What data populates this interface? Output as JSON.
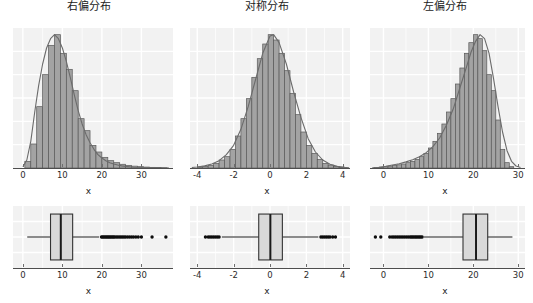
{
  "figure": {
    "width": 533,
    "height": 303,
    "background": "#ffffff",
    "panel_background": "#f2f2f2",
    "gridline_color": "#ffffff",
    "bar_fill": "#a3a3a3",
    "bar_stroke": "#595959",
    "density_stroke": "#6b6b6b",
    "box_fill": "#d9d9d9",
    "box_stroke": "#333333",
    "median_color": "#1a1a1a",
    "whisker_color": "#1a1a1a",
    "outlier_color": "#0d0d0d",
    "axis_color": "#4d4d4d"
  },
  "panels": [
    {
      "id": "right-skewed",
      "title": "右偏分布",
      "xlabel": "x",
      "xlim": [
        -2.5,
        38
      ],
      "xticks": [
        0,
        10,
        20,
        30
      ],
      "xtick_labels": [
        "0",
        "10",
        "20",
        "30"
      ]
    },
    {
      "id": "symmetric",
      "title": "对称分布",
      "xlabel": "x",
      "xlim": [
        -4.4,
        4.4
      ],
      "xticks": [
        -4,
        -2,
        0,
        2,
        4
      ],
      "xtick_labels": [
        "-4",
        "-2",
        "0",
        "2",
        "4"
      ]
    },
    {
      "id": "left-skewed",
      "title": "左偏分布",
      "xlabel": "x",
      "xlim": [
        -3.0,
        31.5
      ],
      "xticks": [
        0,
        10,
        20,
        30
      ],
      "xtick_labels": [
        "0",
        "10",
        "20",
        "30"
      ]
    }
  ],
  "chart_data": [
    {
      "type": "bar",
      "id": "hist-right-skewed",
      "title": "右偏分布",
      "xlabel": "x",
      "ylabel": "",
      "xlim": [
        -2.5,
        38
      ],
      "ylim": [
        0,
        1.05
      ],
      "xticks": [
        0,
        10,
        20,
        30
      ],
      "grid": true,
      "note": "histogram with overlaid kernel density curve; heights normalized to peak = 1.0",
      "bin_edges": [
        0.5,
        2.0,
        3.5,
        5.0,
        6.5,
        8.0,
        9.5,
        11.0,
        12.5,
        14.0,
        15.5,
        17.0,
        18.5,
        20.0,
        21.5,
        23.0,
        24.5,
        26.0,
        27.5,
        29.0,
        30.5,
        32.0,
        33.5,
        35.0,
        36.5
      ],
      "bin_centers": [
        1.25,
        2.75,
        4.25,
        5.75,
        7.25,
        8.75,
        10.25,
        11.75,
        13.25,
        14.75,
        16.25,
        17.75,
        19.25,
        20.75,
        22.25,
        23.75,
        25.25,
        26.75,
        28.25,
        29.75,
        31.25,
        32.75,
        34.25,
        35.75
      ],
      "values": [
        0.05,
        0.18,
        0.46,
        0.7,
        0.92,
        1.0,
        0.86,
        0.74,
        0.58,
        0.37,
        0.28,
        0.17,
        0.12,
        0.08,
        0.055,
        0.04,
        0.028,
        0.02,
        0.014,
        0.01,
        0.007,
        0.005,
        0.003,
        0.002
      ],
      "density_curve": [
        [
          0.0,
          0.01
        ],
        [
          1.0,
          0.06
        ],
        [
          2.0,
          0.2
        ],
        [
          3.0,
          0.42
        ],
        [
          4.0,
          0.62
        ],
        [
          5.0,
          0.78
        ],
        [
          6.0,
          0.9
        ],
        [
          7.0,
          0.97
        ],
        [
          8.0,
          1.0
        ],
        [
          9.0,
          0.97
        ],
        [
          10.0,
          0.9
        ],
        [
          11.0,
          0.8
        ],
        [
          12.0,
          0.68
        ],
        [
          13.0,
          0.55
        ],
        [
          14.0,
          0.43
        ],
        [
          15.0,
          0.33
        ],
        [
          16.0,
          0.25
        ],
        [
          17.0,
          0.19
        ],
        [
          18.0,
          0.14
        ],
        [
          19.0,
          0.1
        ],
        [
          20.0,
          0.075
        ],
        [
          21.0,
          0.055
        ],
        [
          22.0,
          0.04
        ],
        [
          23.0,
          0.03
        ],
        [
          24.0,
          0.022
        ],
        [
          25.0,
          0.016
        ],
        [
          26.0,
          0.012
        ],
        [
          27.0,
          0.009
        ],
        [
          28.0,
          0.006
        ],
        [
          30.0,
          0.004
        ],
        [
          32.0,
          0.002
        ],
        [
          34.0,
          0.001
        ],
        [
          37.0,
          0.0
        ]
      ]
    },
    {
      "type": "bar",
      "id": "hist-symmetric",
      "title": "对称分布",
      "xlabel": "x",
      "ylabel": "",
      "xlim": [
        -4.4,
        4.4
      ],
      "ylim": [
        0,
        1.05
      ],
      "xticks": [
        -4,
        -2,
        0,
        2,
        4
      ],
      "grid": true,
      "note": "histogram with overlaid kernel density curve; heights normalized to peak = 1.0",
      "bin_centers": [
        -3.85,
        -3.55,
        -3.25,
        -2.95,
        -2.65,
        -2.35,
        -2.05,
        -1.75,
        -1.45,
        -1.15,
        -0.85,
        -0.55,
        -0.25,
        0.05,
        0.35,
        0.65,
        0.95,
        1.25,
        1.55,
        1.85,
        2.15,
        2.45,
        2.75,
        3.05,
        3.35,
        3.65,
        3.95
      ],
      "values": [
        0.008,
        0.012,
        0.02,
        0.035,
        0.06,
        0.085,
        0.14,
        0.24,
        0.37,
        0.52,
        0.68,
        0.82,
        0.93,
        1.0,
        0.96,
        0.86,
        0.73,
        0.56,
        0.4,
        0.27,
        0.17,
        0.11,
        0.065,
        0.035,
        0.022,
        0.012,
        0.006
      ],
      "density_curve": [
        [
          -4.3,
          0.004
        ],
        [
          -4.0,
          0.008
        ],
        [
          -3.6,
          0.016
        ],
        [
          -3.2,
          0.03
        ],
        [
          -2.8,
          0.055
        ],
        [
          -2.4,
          0.1
        ],
        [
          -2.0,
          0.17
        ],
        [
          -1.6,
          0.29
        ],
        [
          -1.2,
          0.46
        ],
        [
          -0.8,
          0.66
        ],
        [
          -0.4,
          0.86
        ],
        [
          0.0,
          0.99
        ],
        [
          0.2,
          1.0
        ],
        [
          0.5,
          0.94
        ],
        [
          0.9,
          0.78
        ],
        [
          1.3,
          0.57
        ],
        [
          1.7,
          0.38
        ],
        [
          2.1,
          0.22
        ],
        [
          2.5,
          0.12
        ],
        [
          2.9,
          0.06
        ],
        [
          3.3,
          0.028
        ],
        [
          3.7,
          0.012
        ],
        [
          4.1,
          0.005
        ],
        [
          4.35,
          0.002
        ]
      ]
    },
    {
      "type": "bar",
      "id": "hist-left-skewed",
      "title": "左偏分布",
      "xlabel": "x",
      "ylabel": "",
      "xlim": [
        -3.0,
        31.5
      ],
      "ylim": [
        0,
        1.05
      ],
      "xticks": [
        0,
        10,
        20,
        30
      ],
      "grid": true,
      "note": "histogram with overlaid kernel density curve; heights normalized to peak = 1.0",
      "bin_centers": [
        -1.5,
        -0.5,
        0.5,
        1.5,
        2.5,
        3.5,
        4.5,
        5.5,
        6.5,
        7.5,
        8.5,
        9.5,
        10.5,
        11.5,
        12.5,
        13.5,
        14.5,
        15.5,
        16.5,
        17.5,
        18.5,
        19.5,
        20.5,
        21.5,
        22.5,
        23.5,
        24.5,
        25.5,
        26.5,
        27.5,
        28.5
      ],
      "values": [
        0.004,
        0.006,
        0.01,
        0.014,
        0.018,
        0.024,
        0.03,
        0.04,
        0.05,
        0.065,
        0.085,
        0.11,
        0.15,
        0.2,
        0.26,
        0.33,
        0.42,
        0.52,
        0.63,
        0.75,
        0.86,
        0.94,
        1.0,
        0.97,
        0.88,
        0.7,
        0.58,
        0.36,
        0.14,
        0.04,
        0.01
      ],
      "density_curve": [
        [
          -2.5,
          0.002
        ],
        [
          -1.0,
          0.006
        ],
        [
          0.5,
          0.012
        ],
        [
          2.0,
          0.022
        ],
        [
          3.5,
          0.032
        ],
        [
          5.0,
          0.046
        ],
        [
          6.5,
          0.062
        ],
        [
          8.0,
          0.085
        ],
        [
          9.5,
          0.115
        ],
        [
          11.0,
          0.16
        ],
        [
          12.5,
          0.225
        ],
        [
          14.0,
          0.32
        ],
        [
          15.5,
          0.44
        ],
        [
          17.0,
          0.6
        ],
        [
          18.5,
          0.76
        ],
        [
          19.5,
          0.87
        ],
        [
          20.5,
          0.95
        ],
        [
          21.5,
          1.0
        ],
        [
          22.5,
          0.97
        ],
        [
          23.5,
          0.86
        ],
        [
          24.5,
          0.67
        ],
        [
          25.5,
          0.46
        ],
        [
          26.5,
          0.27
        ],
        [
          27.5,
          0.13
        ],
        [
          28.5,
          0.05
        ],
        [
          29.5,
          0.015
        ],
        [
          30.5,
          0.004
        ]
      ]
    },
    {
      "type": "box",
      "id": "box-right-skewed",
      "xlabel": "x",
      "xlim": [
        -2.5,
        38
      ],
      "xticks": [
        0,
        10,
        20,
        30
      ],
      "grid": true,
      "stats": {
        "whisker_low": 1.1,
        "q1": 7.0,
        "median": 9.6,
        "q3": 12.6,
        "whisker_high": 19.3
      },
      "outliers": [
        19.9,
        20.2,
        20.5,
        20.8,
        21.1,
        21.4,
        21.7,
        22.0,
        22.3,
        22.6,
        22.9,
        23.2,
        23.6,
        24.0,
        24.4,
        24.8,
        25.2,
        25.6,
        26.0,
        26.5,
        27.0,
        27.5,
        28.0,
        28.6,
        29.2,
        30.0,
        32.7,
        36.2
      ]
    },
    {
      "type": "box",
      "id": "box-symmetric",
      "xlabel": "x",
      "xlim": [
        -4.4,
        4.4
      ],
      "xticks": [
        -4,
        -2,
        0,
        2,
        4
      ],
      "grid": true,
      "stats": {
        "whisker_low": -2.65,
        "q1": -0.62,
        "median": 0.02,
        "q3": 0.68,
        "whisker_high": 2.66
      },
      "outliers": [
        -3.55,
        -3.4,
        -3.3,
        -3.2,
        -3.1,
        -3.0,
        -2.9,
        -2.8,
        2.8,
        2.9,
        3.0,
        3.1,
        3.2,
        3.3,
        3.45,
        3.6
      ]
    },
    {
      "type": "box",
      "id": "box-left-skewed",
      "xlabel": "x",
      "xlim": [
        -3.0,
        31.5
      ],
      "xticks": [
        0,
        10,
        20,
        30
      ],
      "grid": true,
      "stats": {
        "whisker_low": 9.0,
        "q1": 17.7,
        "median": 20.6,
        "q3": 23.2,
        "whisker_high": 28.7
      },
      "outliers": [
        -1.8,
        -0.6,
        1.4,
        1.9,
        2.3,
        2.7,
        3.1,
        3.5,
        3.9,
        4.3,
        4.7,
        5.1,
        5.5,
        5.9,
        6.2,
        6.5,
        6.8,
        7.1,
        7.4,
        7.7,
        8.0,
        8.3,
        8.6
      ]
    }
  ]
}
